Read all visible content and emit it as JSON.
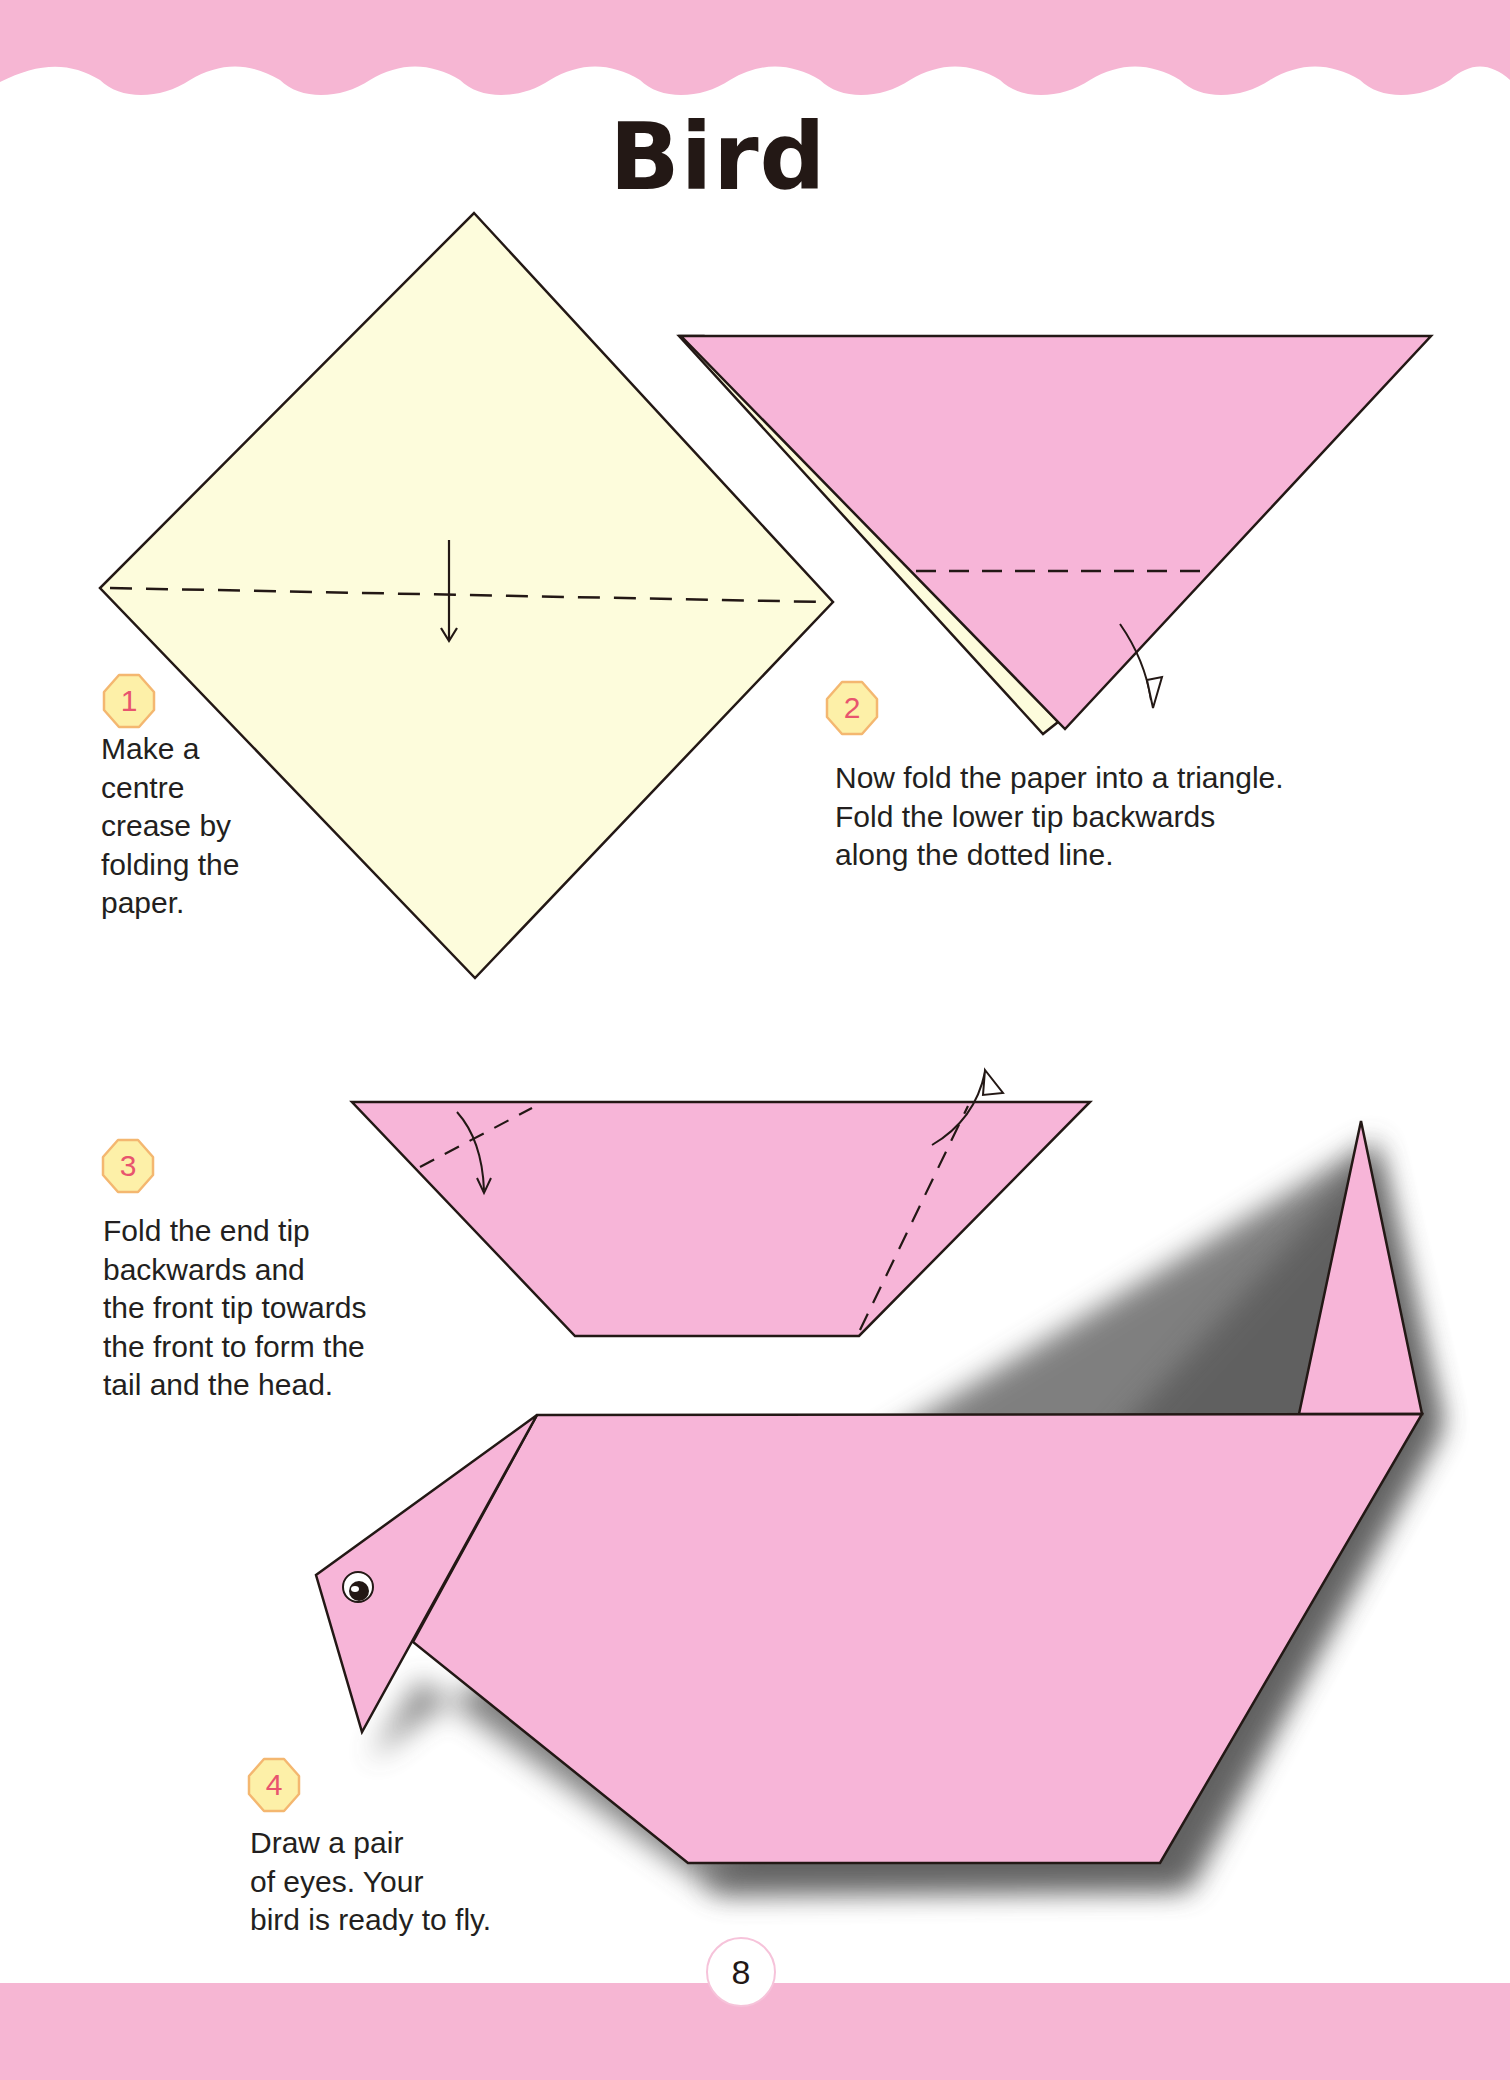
{
  "page": {
    "title": "Bird",
    "page_number": "8",
    "colors": {
      "band_pink": "#f6b6d3",
      "paper_pink": "#f7b5d8",
      "paper_yellow": "#fdfcdc",
      "badge_fill": "#fdf0a8",
      "badge_border": "#f4b770",
      "badge_number": "#e8546e",
      "text": "#231f20"
    }
  },
  "steps": [
    {
      "number": "1",
      "text": "Make a\ncentre\ncrease by\nfolding the\npaper.",
      "diagram": "yellow-square-diamond-with-horizontal-crease"
    },
    {
      "number": "2",
      "text": "Now fold the paper into a triangle.\nFold the lower tip backwards\nalong the dotted line.",
      "diagram": "pink-triangle-with-dotted-fold-line"
    },
    {
      "number": "3",
      "text": "Fold the end tip\nbackwards and\nthe front tip towards\nthe front to form the\ntail and the head.",
      "diagram": "pink-trapezoid-with-two-fold-lines"
    },
    {
      "number": "4",
      "text": "Draw a pair\nof eyes. Your\nbird is ready to fly.",
      "diagram": "finished-pink-origami-bird"
    }
  ]
}
